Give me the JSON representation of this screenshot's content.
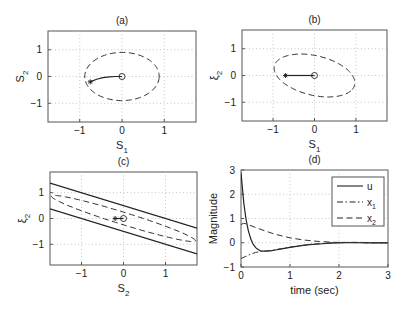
{
  "chart_data": [
    {
      "id": "a",
      "type": "line",
      "title": "(a)",
      "xlabel": "S",
      "xlabel_sub": "1",
      "ylabel": "S",
      "ylabel_sub": "2",
      "xlim": [
        -1.75,
        1.75
      ],
      "ylim": [
        -1.7,
        1.7
      ],
      "xticks": [
        -1,
        0,
        1
      ],
      "yticks": [
        -1,
        0,
        1
      ],
      "grid": true,
      "series": [
        {
          "name": "region-ellipse",
          "style": "dashed",
          "kind": "ellipse",
          "center": [
            0,
            0
          ],
          "radii": [
            0.88,
            0.9
          ],
          "angle_deg": -5
        },
        {
          "name": "trajectory",
          "style": "solid",
          "x": [
            -0.75,
            -0.6,
            -0.45,
            -0.3,
            -0.15,
            0
          ],
          "y": [
            -0.2,
            -0.1,
            -0.04,
            -0.01,
            0,
            0
          ]
        }
      ],
      "markers": [
        {
          "name": "initial-state",
          "symbol": "asterisk",
          "x": -0.75,
          "y": -0.2
        },
        {
          "name": "origin",
          "symbol": "circle",
          "x": 0,
          "y": 0
        }
      ]
    },
    {
      "id": "b",
      "type": "line",
      "title": "(b)",
      "xlabel": "S",
      "xlabel_sub": "1",
      "ylabel": "ξ",
      "ylabel_sub": "2",
      "xlim": [
        -1.75,
        1.75
      ],
      "ylim": [
        -1.7,
        1.7
      ],
      "xticks": [
        -1,
        0,
        1
      ],
      "yticks": [
        -1,
        0,
        1
      ],
      "grid": true,
      "series": [
        {
          "name": "region-ellipse",
          "style": "dashed",
          "kind": "ellipse",
          "center": [
            0,
            0
          ],
          "radii": [
            1.05,
            0.7
          ],
          "angle_deg": -30
        },
        {
          "name": "trajectory",
          "style": "solid",
          "x": [
            -0.7,
            0
          ],
          "y": [
            0,
            0
          ]
        }
      ],
      "markers": [
        {
          "name": "initial-state",
          "symbol": "asterisk",
          "x": -0.7,
          "y": 0
        },
        {
          "name": "origin",
          "symbol": "circle",
          "x": 0,
          "y": 0
        }
      ]
    },
    {
      "id": "c",
      "type": "line",
      "title": "(c)",
      "xlabel": "S",
      "xlabel_sub": "2",
      "ylabel": "ξ",
      "ylabel_sub": "2",
      "xlim": [
        -1.75,
        1.75
      ],
      "ylim": [
        -1.8,
        1.8
      ],
      "xticks": [
        -1,
        0,
        1
      ],
      "yticks": [
        -1,
        0,
        1
      ],
      "grid": true,
      "series": [
        {
          "name": "upper-bound-line",
          "style": "solid",
          "x": [
            -1.75,
            1.75
          ],
          "y": [
            1.375,
            -0.375
          ]
        },
        {
          "name": "lower-bound-line",
          "style": "solid",
          "x": [
            -1.75,
            1.75
          ],
          "y": [
            0.375,
            -1.375
          ]
        },
        {
          "name": "region-ellipse",
          "style": "dashed",
          "kind": "ellipse",
          "center": [
            0,
            0
          ],
          "radii": [
            1.92,
            0.22
          ],
          "angle_deg": -27
        },
        {
          "name": "trajectory",
          "style": "solid",
          "x": [
            -0.2,
            0
          ],
          "y": [
            0,
            0
          ]
        }
      ],
      "markers": [
        {
          "name": "initial-state",
          "symbol": "asterisk",
          "x": -0.2,
          "y": 0
        },
        {
          "name": "origin",
          "symbol": "circle",
          "x": 0,
          "y": 0
        }
      ]
    },
    {
      "id": "d",
      "type": "line",
      "title": "(d)",
      "xlabel": "time (sec)",
      "ylabel": "Magnitude",
      "xlim": [
        0,
        3
      ],
      "ylim": [
        -1,
        3
      ],
      "xticks": [
        0,
        1,
        2,
        3
      ],
      "yticks": [
        -1,
        0,
        1,
        2,
        3
      ],
      "grid": true,
      "legend": {
        "placement": "top-right",
        "entries": [
          {
            "label": "u",
            "sub": "",
            "style": "solid"
          },
          {
            "label": "x",
            "sub": "1",
            "style": "dashdot"
          },
          {
            "label": "x",
            "sub": "2",
            "style": "dashed"
          }
        ]
      },
      "series": [
        {
          "name": "u",
          "style": "solid",
          "x": [
            0,
            0.03,
            0.06,
            0.1,
            0.15,
            0.2,
            0.25,
            0.3,
            0.35,
            0.4,
            0.45,
            0.5,
            0.6,
            0.7,
            0.8,
            1.0,
            1.2,
            1.4,
            1.6,
            1.8,
            2.0,
            2.3,
            2.6,
            3.0
          ],
          "y": [
            2.9,
            2.2,
            1.6,
            1.0,
            0.5,
            0.15,
            -0.07,
            -0.2,
            -0.28,
            -0.33,
            -0.35,
            -0.35,
            -0.33,
            -0.3,
            -0.26,
            -0.19,
            -0.13,
            -0.08,
            -0.05,
            -0.02,
            0,
            0.01,
            0,
            0
          ]
        },
        {
          "name": "x1",
          "style": "dashdot",
          "x": [
            0,
            0.1,
            0.2,
            0.3,
            0.4,
            0.45,
            0.5,
            0.6,
            0.7,
            0.8,
            1.0,
            1.2,
            1.4,
            1.6,
            1.8,
            2.0,
            2.3,
            2.6,
            3.0
          ],
          "y": [
            -0.65,
            -0.56,
            -0.47,
            -0.4,
            -0.36,
            -0.35,
            -0.34,
            -0.32,
            -0.29,
            -0.25,
            -0.18,
            -0.12,
            -0.07,
            -0.04,
            -0.01,
            0.01,
            0.02,
            0.01,
            0
          ]
        },
        {
          "name": "x2",
          "style": "dashed",
          "x": [
            0,
            0.05,
            0.1,
            0.3,
            0.5,
            0.7,
            1.0,
            1.3,
            1.6,
            1.9,
            2.2,
            2.6,
            3.0
          ],
          "y": [
            0.75,
            0.8,
            0.78,
            0.63,
            0.48,
            0.35,
            0.2,
            0.11,
            0.05,
            0.02,
            0.01,
            0,
            0
          ]
        }
      ]
    }
  ]
}
